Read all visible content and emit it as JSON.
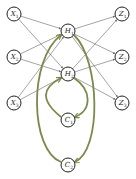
{
  "diagram": {
    "title": "",
    "colors": {
      "node_stroke": "#222222",
      "edge": "#666666",
      "feedback_edge": "#7a8a4a"
    },
    "nodes": [
      {
        "id": "X1",
        "label": "X",
        "sub": "1",
        "x": 14,
        "y": 14
      },
      {
        "id": "X2",
        "label": "X",
        "sub": "2",
        "x": 14,
        "y": 57
      },
      {
        "id": "X3",
        "label": "X",
        "sub": "3",
        "x": 14,
        "y": 103
      },
      {
        "id": "H1",
        "label": "H",
        "sub": "1",
        "x": 68,
        "y": 31
      },
      {
        "id": "H2",
        "label": "H",
        "sub": "2",
        "x": 68,
        "y": 74
      },
      {
        "id": "Z1",
        "label": "Z",
        "sub": "1",
        "x": 122,
        "y": 14
      },
      {
        "id": "Z2",
        "label": "Z",
        "sub": "2",
        "x": 122,
        "y": 57
      },
      {
        "id": "Z3",
        "label": "Z",
        "sub": "3",
        "x": 122,
        "y": 103
      },
      {
        "id": "C1",
        "label": "C",
        "sub": "1",
        "x": 68,
        "y": 120
      },
      {
        "id": "C2",
        "label": "C",
        "sub": "2",
        "x": 68,
        "y": 165
      }
    ],
    "edges": [
      {
        "from": "X1",
        "to": "H1"
      },
      {
        "from": "X1",
        "to": "H2"
      },
      {
        "from": "X2",
        "to": "H1"
      },
      {
        "from": "X2",
        "to": "H2"
      },
      {
        "from": "X3",
        "to": "H1"
      },
      {
        "from": "X3",
        "to": "H2"
      },
      {
        "from": "H1",
        "to": "Z1"
      },
      {
        "from": "H1",
        "to": "Z2"
      },
      {
        "from": "H1",
        "to": "Z3"
      },
      {
        "from": "H2",
        "to": "Z1"
      },
      {
        "from": "H2",
        "to": "Z2"
      },
      {
        "from": "H2",
        "to": "Z3"
      }
    ],
    "feedback_edges": [
      {
        "from": "H1",
        "to": "C2",
        "side": "right",
        "path": "M74,35 C100,60 102,150 75,162"
      },
      {
        "from": "H2",
        "to": "C1",
        "side": "right",
        "path": "M74,78 C92,90 92,110 75,117"
      },
      {
        "from": "C1",
        "to": "H2",
        "side": "left",
        "path": "M61,117 C40,100 42,88 61,78"
      },
      {
        "from": "C2",
        "to": "H1",
        "side": "left",
        "path": "M61,162 C30,150 28,60 61,35"
      }
    ]
  }
}
